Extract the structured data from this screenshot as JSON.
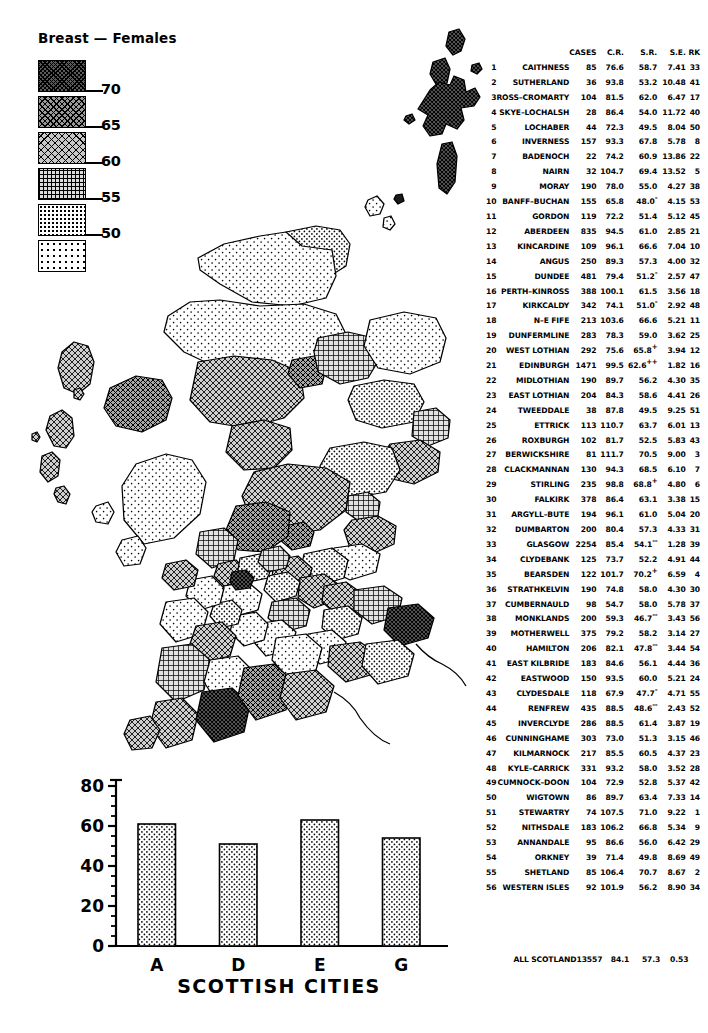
{
  "title": "Breast — Females",
  "legend": {
    "name": "standardised-rate-legend",
    "classes": [
      {
        "pattern": "pat-1",
        "upper_tick": "70"
      },
      {
        "pattern": "pat-2",
        "upper_tick": "65"
      },
      {
        "pattern": "pat-3",
        "upper_tick": "60"
      },
      {
        "pattern": "pat-4",
        "upper_tick": "55"
      },
      {
        "pattern": "pat-5",
        "upper_tick": "50"
      },
      {
        "pattern": "pat-6",
        "upper_tick": ""
      }
    ]
  },
  "chart_data": {
    "type": "bar",
    "title": "",
    "xlabel": "SCOTTISH CITIES",
    "ylabel": "",
    "categories": [
      "A",
      "D",
      "E",
      "G"
    ],
    "values": [
      61,
      51,
      63,
      54
    ],
    "ylim": [
      0,
      80
    ],
    "yticks": [
      "0",
      "20",
      "40",
      "60",
      "80"
    ],
    "ytick_values": [
      0,
      20,
      40,
      60,
      80
    ],
    "minor_tick_step": 5,
    "grid": false,
    "legend_position": "none"
  },
  "table": {
    "name": "district-rates-table",
    "headers": {
      "rk": "",
      "name": "",
      "cases": "CASES",
      "cr": "C.R.",
      "sr": "S.R.",
      "se": "S.E.",
      "rank": "RK"
    },
    "rows": [
      {
        "n": "1",
        "name": "CAITHNESS",
        "cases": "85",
        "cr": "76.6",
        "sr": "58.7",
        "sig": "",
        "se": "7.41",
        "rank": "33"
      },
      {
        "n": "2",
        "name": "SUTHERLAND",
        "cases": "36",
        "cr": "93.8",
        "sr": "53.2",
        "sig": "",
        "se": "10.48",
        "rank": "41"
      },
      {
        "n": "3",
        "name": "ROSS–CROMARTY",
        "cases": "104",
        "cr": "81.5",
        "sr": "62.0",
        "sig": "",
        "se": "6.47",
        "rank": "17"
      },
      {
        "n": "4",
        "name": "SKYE–LOCHALSH",
        "cases": "28",
        "cr": "86.4",
        "sr": "54.0",
        "sig": "",
        "se": "11.72",
        "rank": "40"
      },
      {
        "n": "5",
        "name": "LOCHABER",
        "cases": "44",
        "cr": "72.3",
        "sr": "49.5",
        "sig": "",
        "se": "8.04",
        "rank": "50"
      },
      {
        "n": "6",
        "name": "INVERNESS",
        "cases": "157",
        "cr": "93.3",
        "sr": "67.8",
        "sig": "",
        "se": "5.78",
        "rank": "8"
      },
      {
        "n": "7",
        "name": "BADENOCH",
        "cases": "22",
        "cr": "74.2",
        "sr": "60.9",
        "sig": "",
        "se": "13.86",
        "rank": "22"
      },
      {
        "n": "8",
        "name": "NAIRN",
        "cases": "32",
        "cr": "104.7",
        "sr": "69.4",
        "sig": "",
        "se": "13.52",
        "rank": "5"
      },
      {
        "n": "9",
        "name": "MORAY",
        "cases": "190",
        "cr": "78.0",
        "sr": "55.0",
        "sig": "",
        "se": "4.27",
        "rank": "38"
      },
      {
        "n": "10",
        "name": "BANFF–BUCHAN",
        "cases": "155",
        "cr": "65.8",
        "sr": "48.0",
        "sig": "-",
        "se": "4.15",
        "rank": "53"
      },
      {
        "n": "11",
        "name": "GORDON",
        "cases": "119",
        "cr": "72.2",
        "sr": "51.4",
        "sig": "",
        "se": "5.12",
        "rank": "45"
      },
      {
        "n": "12",
        "name": "ABERDEEN",
        "cases": "835",
        "cr": "94.5",
        "sr": "61.0",
        "sig": "",
        "se": "2.85",
        "rank": "21"
      },
      {
        "n": "13",
        "name": "KINCARDINE",
        "cases": "109",
        "cr": "96.1",
        "sr": "66.6",
        "sig": "",
        "se": "7.04",
        "rank": "10"
      },
      {
        "n": "14",
        "name": "ANGUS",
        "cases": "250",
        "cr": "89.3",
        "sr": "57.3",
        "sig": "",
        "se": "4.00",
        "rank": "32"
      },
      {
        "n": "15",
        "name": "DUNDEE",
        "cases": "481",
        "cr": "79.4",
        "sr": "51.2",
        "sig": "-",
        "se": "2.57",
        "rank": "47"
      },
      {
        "n": "16",
        "name": "PERTH–KINROSS",
        "cases": "388",
        "cr": "100.1",
        "sr": "61.5",
        "sig": "",
        "se": "3.56",
        "rank": "18"
      },
      {
        "n": "17",
        "name": "KIRKCALDY",
        "cases": "342",
        "cr": "74.1",
        "sr": "51.0",
        "sig": "-",
        "se": "2.92",
        "rank": "48"
      },
      {
        "n": "18",
        "name": "N–E FIFE",
        "cases": "213",
        "cr": "103.6",
        "sr": "66.6",
        "sig": "",
        "se": "5.21",
        "rank": "11"
      },
      {
        "n": "19",
        "name": "DUNFERMLINE",
        "cases": "283",
        "cr": "78.3",
        "sr": "59.0",
        "sig": "",
        "se": "3.62",
        "rank": "25"
      },
      {
        "n": "20",
        "name": "WEST LOTHIAN",
        "cases": "292",
        "cr": "75.6",
        "sr": "65.8",
        "sig": "+",
        "se": "3.94",
        "rank": "12"
      },
      {
        "n": "21",
        "name": "EDINBURGH",
        "cases": "1471",
        "cr": "99.5",
        "sr": "62.6",
        "sig": "++",
        "se": "1.82",
        "rank": "16"
      },
      {
        "n": "22",
        "name": "MIDLOTHIAN",
        "cases": "190",
        "cr": "89.7",
        "sr": "56.2",
        "sig": "",
        "se": "4.30",
        "rank": "35"
      },
      {
        "n": "23",
        "name": "EAST LOTHIAN",
        "cases": "204",
        "cr": "84.3",
        "sr": "58.6",
        "sig": "",
        "se": "4.41",
        "rank": "26"
      },
      {
        "n": "24",
        "name": "TWEEDDALE",
        "cases": "38",
        "cr": "87.8",
        "sr": "49.5",
        "sig": "",
        "se": "9.25",
        "rank": "51"
      },
      {
        "n": "25",
        "name": "ETTRICK",
        "cases": "113",
        "cr": "110.7",
        "sr": "63.7",
        "sig": "",
        "se": "6.01",
        "rank": "13"
      },
      {
        "n": "26",
        "name": "ROXBURGH",
        "cases": "102",
        "cr": "81.7",
        "sr": "52.5",
        "sig": "",
        "se": "5.83",
        "rank": "43"
      },
      {
        "n": "27",
        "name": "BERWICKSHIRE",
        "cases": "81",
        "cr": "111.7",
        "sr": "70.5",
        "sig": "",
        "se": "9.00",
        "rank": "3"
      },
      {
        "n": "28",
        "name": "CLACKMANNAN",
        "cases": "130",
        "cr": "94.3",
        "sr": "68.5",
        "sig": "",
        "se": "6.10",
        "rank": "7"
      },
      {
        "n": "29",
        "name": "STIRLING",
        "cases": "235",
        "cr": "98.8",
        "sr": "68.8",
        "sig": "+",
        "se": "4.80",
        "rank": "6"
      },
      {
        "n": "30",
        "name": "FALKIRK",
        "cases": "378",
        "cr": "86.4",
        "sr": "63.1",
        "sig": "",
        "se": "3.38",
        "rank": "15"
      },
      {
        "n": "31",
        "name": "ARGYLL–BUTE",
        "cases": "194",
        "cr": "96.1",
        "sr": "61.0",
        "sig": "",
        "se": "5.04",
        "rank": "20"
      },
      {
        "n": "32",
        "name": "DUMBARTON",
        "cases": "200",
        "cr": "80.4",
        "sr": "57.3",
        "sig": "",
        "se": "4.33",
        "rank": "31"
      },
      {
        "n": "33",
        "name": "GLASGOW",
        "cases": "2254",
        "cr": "85.4",
        "sr": "54.1",
        "sig": "--",
        "se": "1.28",
        "rank": "39"
      },
      {
        "n": "34",
        "name": "CLYDEBANK",
        "cases": "125",
        "cr": "73.7",
        "sr": "52.2",
        "sig": "",
        "se": "4.91",
        "rank": "44"
      },
      {
        "n": "35",
        "name": "BEARSDEN",
        "cases": "122",
        "cr": "101.7",
        "sr": "70.2",
        "sig": "+",
        "se": "6.59",
        "rank": "4"
      },
      {
        "n": "36",
        "name": "STRATHKELVIN",
        "cases": "190",
        "cr": "74.8",
        "sr": "58.0",
        "sig": "",
        "se": "4.30",
        "rank": "30"
      },
      {
        "n": "37",
        "name": "CUMBERNAULD",
        "cases": "98",
        "cr": "54.7",
        "sr": "58.0",
        "sig": "",
        "se": "5.78",
        "rank": "37"
      },
      {
        "n": "38",
        "name": "MONKLANDS",
        "cases": "200",
        "cr": "59.3",
        "sr": "46.7",
        "sig": "--",
        "se": "3.43",
        "rank": "56"
      },
      {
        "n": "39",
        "name": "MOTHERWELL",
        "cases": "375",
        "cr": "79.2",
        "sr": "58.2",
        "sig": "",
        "se": "3.14",
        "rank": "27"
      },
      {
        "n": "40",
        "name": "HAMILTON",
        "cases": "206",
        "cr": "82.1",
        "sr": "47.8",
        "sig": "--",
        "se": "3.44",
        "rank": "54"
      },
      {
        "n": "41",
        "name": "EAST KILBRIDE",
        "cases": "183",
        "cr": "84.6",
        "sr": "56.1",
        "sig": "",
        "se": "4.44",
        "rank": "36"
      },
      {
        "n": "42",
        "name": "EASTWOOD",
        "cases": "150",
        "cr": "93.5",
        "sr": "60.0",
        "sig": "",
        "se": "5.21",
        "rank": "24"
      },
      {
        "n": "43",
        "name": "CLYDESDALE",
        "cases": "118",
        "cr": "67.9",
        "sr": "47.7",
        "sig": "-",
        "se": "4.71",
        "rank": "55"
      },
      {
        "n": "44",
        "name": "RENFREW",
        "cases": "435",
        "cr": "88.5",
        "sr": "48.6",
        "sig": "--",
        "se": "2.43",
        "rank": "52"
      },
      {
        "n": "45",
        "name": "INVERCLYDE",
        "cases": "286",
        "cr": "88.5",
        "sr": "61.4",
        "sig": "",
        "se": "3.87",
        "rank": "19"
      },
      {
        "n": "46",
        "name": "CUNNINGHAME",
        "cases": "303",
        "cr": "73.0",
        "sr": "51.3",
        "sig": "",
        "se": "3.15",
        "rank": "46"
      },
      {
        "n": "47",
        "name": "KILMARNOCK",
        "cases": "217",
        "cr": "85.5",
        "sr": "60.5",
        "sig": "",
        "se": "4.37",
        "rank": "23"
      },
      {
        "n": "48",
        "name": "KYLE–CARRICK",
        "cases": "331",
        "cr": "93.2",
        "sr": "58.0",
        "sig": "",
        "se": "3.52",
        "rank": "28"
      },
      {
        "n": "49",
        "name": "CUMNOCK–DOON",
        "cases": "104",
        "cr": "72.9",
        "sr": "52.8",
        "sig": "",
        "se": "5.37",
        "rank": "42"
      },
      {
        "n": "50",
        "name": "WIGTOWN",
        "cases": "86",
        "cr": "89.7",
        "sr": "63.4",
        "sig": "",
        "se": "7.33",
        "rank": "14"
      },
      {
        "n": "51",
        "name": "STEWARTRY",
        "cases": "74",
        "cr": "107.5",
        "sr": "71.0",
        "sig": "",
        "se": "9.22",
        "rank": "1"
      },
      {
        "n": "52",
        "name": "NITHSDALE",
        "cases": "183",
        "cr": "106.2",
        "sr": "66.8",
        "sig": "",
        "se": "5.34",
        "rank": "9"
      },
      {
        "n": "53",
        "name": "ANNANDALE",
        "cases": "95",
        "cr": "86.6",
        "sr": "56.0",
        "sig": "",
        "se": "6.42",
        "rank": "29"
      },
      {
        "n": "54",
        "name": "ORKNEY",
        "cases": "39",
        "cr": "71.4",
        "sr": "49.8",
        "sig": "",
        "se": "8.69",
        "rank": "49"
      },
      {
        "n": "55",
        "name": "SHETLAND",
        "cases": "85",
        "cr": "106.4",
        "sr": "70.7",
        "sig": "",
        "se": "8.67",
        "rank": "2"
      },
      {
        "n": "56",
        "name": "WESTERN ISLES",
        "cases": "92",
        "cr": "101.9",
        "sr": "56.2",
        "sig": "",
        "se": "8.90",
        "rank": "34"
      }
    ],
    "total": {
      "label": "ALL SCOTLAND",
      "cases": "13557",
      "cr": "84.1",
      "sr": "57.3",
      "se": "0.53",
      "rank": ""
    }
  }
}
